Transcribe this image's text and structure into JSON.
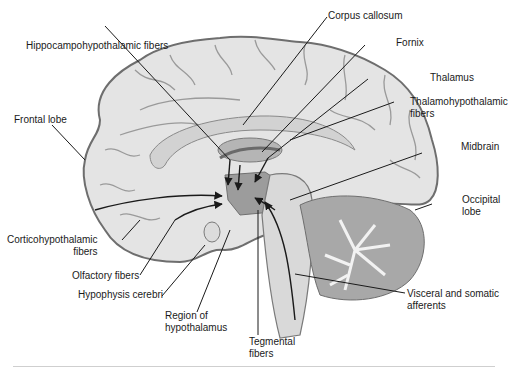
{
  "figure": {
    "labels": [
      {
        "id": "corpus-callosum",
        "lines": [
          "Corpus callosum"
        ]
      },
      {
        "id": "hippocampohypothalamic-fibers",
        "lines": [
          "Hippocampohypothalamic fibers"
        ]
      },
      {
        "id": "fornix",
        "lines": [
          "Fornix"
        ]
      },
      {
        "id": "thalamus",
        "lines": [
          "Thalamus"
        ]
      },
      {
        "id": "thalamohypothalamic-fibers",
        "lines": [
          "Thalamohypothalamic",
          "fibers"
        ]
      },
      {
        "id": "frontal-lobe",
        "lines": [
          "Frontal lobe"
        ]
      },
      {
        "id": "midbrain",
        "lines": [
          "Midbrain"
        ]
      },
      {
        "id": "occipital-lobe",
        "lines": [
          "Occipital",
          "lobe"
        ]
      },
      {
        "id": "corticohypothalamic-fibers",
        "lines": [
          "Corticohypothalamic",
          "fibers"
        ]
      },
      {
        "id": "olfactory-fibers",
        "lines": [
          "Olfactory fibers"
        ]
      },
      {
        "id": "hypophysis-cerebri",
        "lines": [
          "Hypophysis cerebri"
        ]
      },
      {
        "id": "region-of-hypothalamus",
        "lines": [
          "Region of",
          "hypothalamus"
        ]
      },
      {
        "id": "tegmental-fibers",
        "lines": [
          "Tegmental",
          "fibers"
        ]
      },
      {
        "id": "visceral-somatic-afferents",
        "lines": [
          "Visceral and somatic",
          "afferents"
        ]
      }
    ]
  },
  "colors": {
    "brain_fill": "#e4e4e4",
    "brain_outline": "#6e6e6e",
    "sulcus": "#9a9a9a",
    "hypothalamus_fill": "#9c9c9c",
    "thalamus_fill": "#b5b5b5",
    "cerebellum_fill": "#a8a8a8",
    "leader": "#1a1a1a"
  }
}
